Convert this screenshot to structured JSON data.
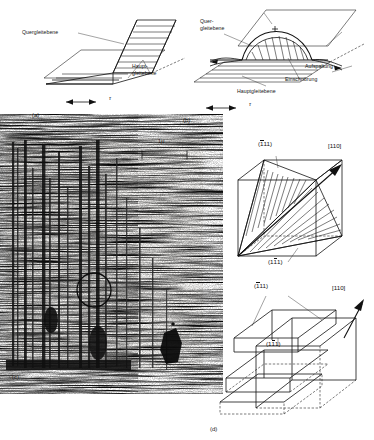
{
  "figure": {
    "domain_note": "Cross-slip (Quergleitung) mechanism in face-centred cubic crystal",
    "panels": [
      {
        "id": "a",
        "label": "(a)",
        "annotations": [
          {
            "name": "cross-slip-plane",
            "text": "Quergleitebene"
          },
          {
            "name": "primary-slip-plane",
            "text": "Haupt-\ngleitebene",
            "line1": "Haupt-",
            "line2": "gleitebene"
          }
        ],
        "stress_symbol": "τ"
      },
      {
        "id": "b",
        "label": "(b)",
        "annotations": [
          {
            "name": "cross-slip-plane",
            "line1": "Quer-",
            "line2": "gleitebene"
          },
          {
            "name": "dissociation",
            "text": "Aufspaltung"
          },
          {
            "name": "constriction",
            "text": "Einschnürung"
          },
          {
            "name": "primary-slip-plane",
            "text": "Hauptgleitebene"
          }
        ],
        "stress_symbol": "τ"
      },
      {
        "id": "c",
        "label": "(c)",
        "type": "micrograph",
        "scale_bar": {
          "value": "1",
          "unit": "μ",
          "text": "1μ"
        }
      },
      {
        "id": "d",
        "label": "(d)",
        "diagrams": [
          {
            "name": "cube-tetrahedron",
            "plane_top": {
              "digits": "111",
              "overbar_index": 0,
              "text": "(111)"
            },
            "plane_bottom": {
              "digits": "111",
              "overbar_index": 1,
              "text": "(111)"
            },
            "direction": "[110]"
          },
          {
            "name": "cube-slip-steps",
            "plane_top": {
              "digits": "111",
              "overbar_index": 0,
              "text": "(111)"
            },
            "plane_inner": {
              "digits": "111",
              "overbar_index": 1,
              "text": "(111)"
            },
            "direction": "[110]"
          }
        ]
      }
    ]
  },
  "colors": {
    "ink": "#111111",
    "paper": "#ffffff",
    "hatch": "#222222"
  }
}
